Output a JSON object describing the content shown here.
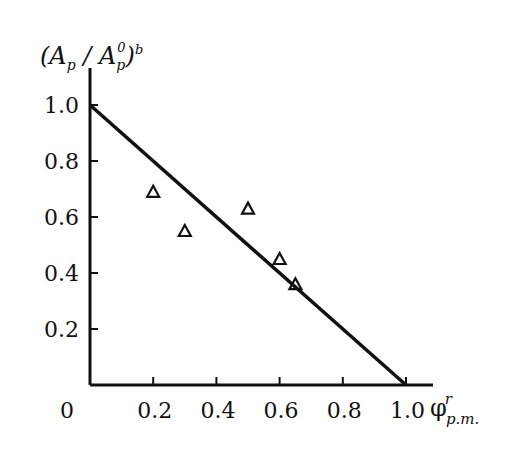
{
  "chart_data": {
    "type": "scatter",
    "title": "",
    "ylabel": "(A_p / A_p^0)^b",
    "xlabel": "φ^r_{p.m.}",
    "xlim": [
      0,
      1.05
    ],
    "ylim": [
      0,
      1.1
    ],
    "x_ticks": [
      "0.2",
      "0.4",
      "0.6",
      "0.8",
      "1.0"
    ],
    "y_ticks": [
      "0.2",
      "0.4",
      "0.6",
      "0.8",
      "1.0"
    ],
    "origin_label": "0",
    "grid": false,
    "series": [
      {
        "name": "experimental",
        "marker": "open-triangle",
        "x": [
          0.2,
          0.3,
          0.5,
          0.6,
          0.65
        ],
        "y": [
          0.69,
          0.55,
          0.63,
          0.45,
          0.36
        ]
      },
      {
        "name": "fit line",
        "type": "line",
        "x": [
          0.0,
          1.0
        ],
        "y": [
          1.0,
          0.0
        ]
      }
    ]
  }
}
